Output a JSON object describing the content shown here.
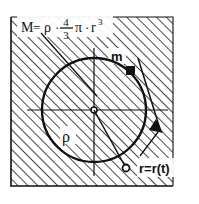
{
  "figure": {
    "background_color": "#ffffff",
    "ink_color": "#111111",
    "hatch_color": "#1a1a1a"
  },
  "labels": {
    "mass_formula": {
      "lead": "M",
      "equals": "=",
      "rho": "ρ",
      "dot1": "·",
      "frac_num": "4",
      "frac_den": "3",
      "pi": "π",
      "dot2": "·",
      "r": "r",
      "exponent": "3",
      "plain": "M = ρ · 4/3 π · r³"
    },
    "point_mass": "m",
    "density": "ρ",
    "radius_function": "r=r(t)"
  },
  "geometry": {
    "hatched_square": {
      "x": 11,
      "y": 17,
      "width": 162,
      "height": 169
    },
    "circle": {
      "cx": 94,
      "cy": 110,
      "r": 52
    },
    "center_marker": {
      "cx": 94,
      "cy": 110,
      "r": 3
    },
    "point_mass_marker": {
      "x": 130,
      "y": 70,
      "size": 8,
      "shape": "filled-square"
    },
    "orbit_marker": {
      "cx": 126,
      "cy": 168,
      "r": 3.5,
      "shape": "open-circle"
    },
    "horizontal_axis": {
      "x1": 27,
      "y1": 110,
      "x2": 168,
      "y2": 110
    },
    "vertical_axis": {
      "x1": 94,
      "y1": 48,
      "x2": 94,
      "y2": 176
    },
    "diagonal_radius": {
      "x1": 94,
      "y1": 110,
      "x2": 126,
      "y2": 168
    },
    "measurement_line": {
      "x1": 140,
      "y1": 62,
      "x2": 161,
      "y2": 130
    },
    "formula_leader": {
      "x1": 41,
      "y1": 33,
      "x2": 96,
      "y2": 95
    },
    "radius_label_leader": {
      "x1": 138,
      "y1": 155,
      "x2": 159,
      "y2": 131
    }
  },
  "hatching": {
    "angle_degrees": 45,
    "spacing_px": 7,
    "line_width_px": 1.6,
    "direction": "up-right"
  }
}
